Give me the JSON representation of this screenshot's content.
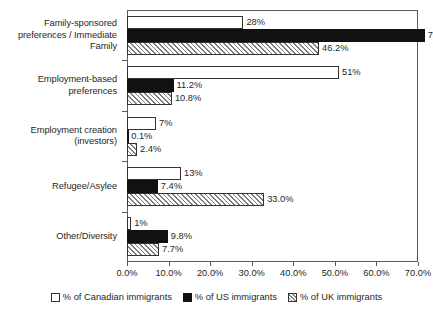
{
  "chart_data": {
    "type": "bar",
    "orientation": "horizontal",
    "title": "",
    "subtitle": "",
    "xlabel": "",
    "ylabel": "",
    "xlim": [
      0,
      70
    ],
    "grid": false,
    "legend_position": "bottom",
    "xticks": [
      "0.0%",
      "10.0%",
      "20.0%",
      "30.0%",
      "40.0%",
      "50.0%",
      "60.0%",
      "70.0%"
    ],
    "xtick_values": [
      0,
      10,
      20,
      30,
      40,
      50,
      60,
      70
    ],
    "categories": [
      "Family-sponsored preferences / Immediate Family",
      "Employment-based preferences",
      "Employment creation (investors)",
      "Refugee/Asylee",
      "Other/Diversity"
    ],
    "series": [
      {
        "name": "% of Canadian immigrants",
        "key": "ca",
        "style": "white",
        "color": "#ffffff",
        "values": [
          28,
          51,
          7,
          13,
          1
        ],
        "labels": [
          "28%",
          "51%",
          "7%",
          "13%",
          "1%"
        ]
      },
      {
        "name": "% of US immigrants",
        "key": "us",
        "style": "black",
        "color": "#111111",
        "values": [
          71.6,
          11.2,
          0.1,
          7.4,
          9.8
        ],
        "labels": [
          "71.6%",
          "11.2%",
          "0.1%",
          "7.4%",
          "9.8%"
        ]
      },
      {
        "name": "% of UK immigrants",
        "key": "uk",
        "style": "hatched",
        "color": "#ffffff",
        "values": [
          46.2,
          10.8,
          2.4,
          33.0,
          7.7
        ],
        "labels": [
          "46.2%",
          "10.8%",
          "2.4%",
          "33.0%",
          "7.7%"
        ]
      }
    ]
  },
  "legend": {
    "items": [
      {
        "label": "% of Canadian immigrants",
        "swatch": "legend-swatch-canadian"
      },
      {
        "label": "% of US immigrants",
        "swatch": "legend-swatch-us"
      },
      {
        "label": "% of UK immigrants",
        "swatch": "legend-swatch-uk"
      }
    ]
  }
}
